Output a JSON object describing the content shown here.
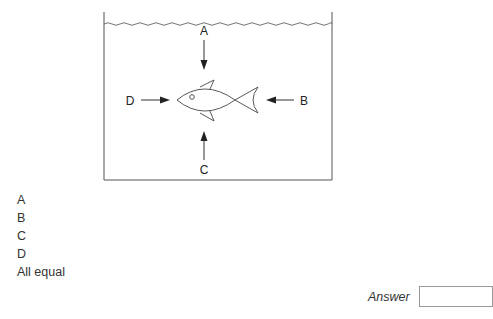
{
  "diagram": {
    "labels": {
      "top": "A",
      "right": "B",
      "bottom": "C",
      "left": "D"
    },
    "colors": {
      "line": "#444444",
      "arrow": "#222222"
    }
  },
  "options": [
    {
      "label": "A"
    },
    {
      "label": "B"
    },
    {
      "label": "C"
    },
    {
      "label": "D"
    },
    {
      "label": "All equal"
    }
  ],
  "answer": {
    "label": "Answer",
    "value": ""
  }
}
